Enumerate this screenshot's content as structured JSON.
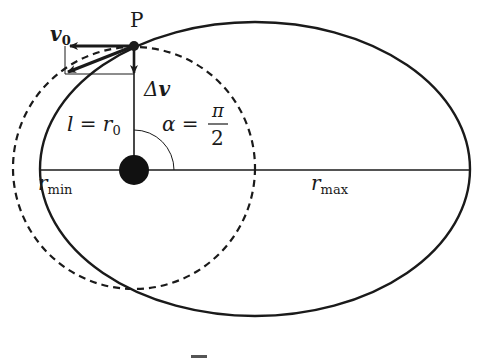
{
  "figure": {
    "type": "orbit-transfer-diagram",
    "colors": {
      "stroke": "#1a1a1a",
      "background": "#ffffff"
    },
    "labels": {
      "point": "P",
      "v0_main": "v",
      "v0_sub": "0",
      "dv_delta": "Δ",
      "dv_v": "v",
      "l_lhs": "l = r",
      "l_sub": "0",
      "alpha_lhs": "α =",
      "alpha_num": "π",
      "alpha_den": "2",
      "rmin_main": "r",
      "rmin_sub": "min",
      "rmax_main": "r",
      "rmax_sub": "max"
    },
    "geometry": {
      "ellipse": {
        "cx": 255,
        "cy": 169,
        "rx": 215,
        "ry": 147,
        "style": "solid"
      },
      "circle": {
        "cx": 134,
        "cy": 168,
        "r": 121,
        "style": "dashed"
      },
      "focus": {
        "cx": 134,
        "cy": 170,
        "r": 15
      },
      "point_P": {
        "x": 134,
        "y": 46
      },
      "angle_alpha": "π/2"
    }
  }
}
